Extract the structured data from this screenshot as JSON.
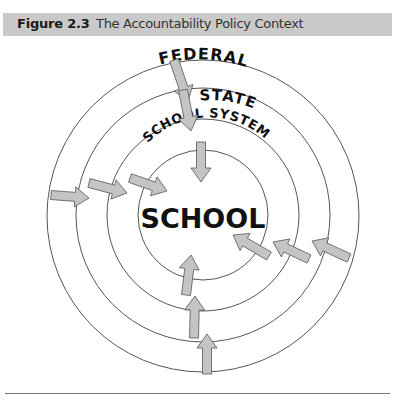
{
  "figure": {
    "number": "Figure 2.3",
    "title": "The Accountability Policy Context"
  },
  "diagram": {
    "rings": [
      {
        "label": "FEDERAL",
        "level": 1
      },
      {
        "label": "STATE",
        "level": 2
      },
      {
        "label": "SCHOOL SYSTEM",
        "level": 3
      },
      {
        "label": "SCHOOL",
        "level": 4
      }
    ],
    "center_label": "SCHOOL",
    "arrow_groups": [
      "top",
      "left",
      "right",
      "bottom"
    ],
    "colors": {
      "arrow_fill": "#c4c4c4",
      "arrow_stroke": "#555555",
      "ring_stroke": "#555555",
      "label": "#111111",
      "header_bg": "#c9c9c9"
    }
  }
}
